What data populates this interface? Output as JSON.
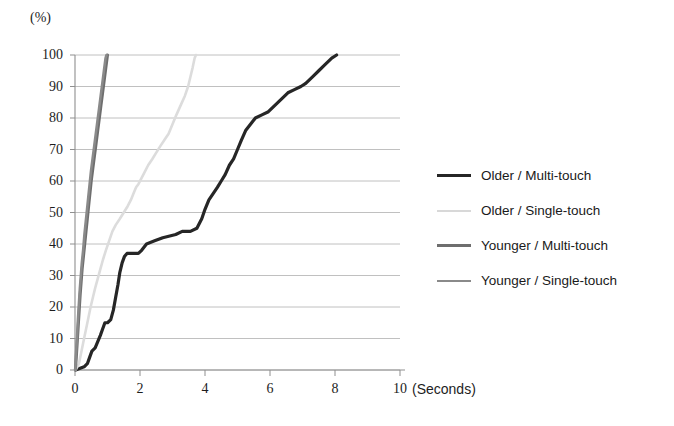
{
  "chart_data": {
    "type": "line",
    "title": "",
    "subtitle": "",
    "xlabel": "(Seconds)",
    "ylabel": "(%)",
    "xlim": [
      0,
      10
    ],
    "ylim": [
      0,
      100
    ],
    "xticks": [
      0,
      2,
      4,
      6,
      8,
      10
    ],
    "yticks": [
      0,
      10,
      20,
      30,
      40,
      50,
      60,
      70,
      80,
      90,
      100
    ],
    "xtick_labels": [
      "0",
      "2",
      "4",
      "6",
      "8",
      "10"
    ],
    "ytick_labels": [
      "0",
      "10",
      "20",
      "30",
      "40",
      "50",
      "60",
      "70",
      "80",
      "90",
      "100"
    ],
    "grid": "horizontal",
    "legend_position": "right",
    "series": [
      {
        "name": "Older / Multi-touch",
        "color": "#262626",
        "width": 3.2,
        "points": [
          [
            0.02,
            0
          ],
          [
            0.28,
            1
          ],
          [
            0.38,
            2
          ],
          [
            0.45,
            4
          ],
          [
            0.52,
            6
          ],
          [
            0.62,
            7
          ],
          [
            0.7,
            9
          ],
          [
            0.78,
            11
          ],
          [
            0.85,
            13
          ],
          [
            0.92,
            15
          ],
          [
            1.0,
            15
          ],
          [
            1.1,
            16
          ],
          [
            1.18,
            19
          ],
          [
            1.25,
            23
          ],
          [
            1.32,
            27
          ],
          [
            1.38,
            31
          ],
          [
            1.45,
            34
          ],
          [
            1.52,
            36
          ],
          [
            1.6,
            37
          ],
          [
            1.95,
            37
          ],
          [
            2.05,
            38
          ],
          [
            2.2,
            40
          ],
          [
            2.45,
            41
          ],
          [
            2.7,
            42
          ],
          [
            3.1,
            43
          ],
          [
            3.3,
            44
          ],
          [
            3.55,
            44
          ],
          [
            3.75,
            45
          ],
          [
            3.9,
            48
          ],
          [
            4.0,
            51
          ],
          [
            4.12,
            54
          ],
          [
            4.25,
            56
          ],
          [
            4.38,
            58
          ],
          [
            4.5,
            60
          ],
          [
            4.62,
            62
          ],
          [
            4.75,
            65
          ],
          [
            4.88,
            67
          ],
          [
            5.0,
            70
          ],
          [
            5.12,
            73
          ],
          [
            5.25,
            76
          ],
          [
            5.4,
            78
          ],
          [
            5.55,
            80
          ],
          [
            5.75,
            81
          ],
          [
            5.95,
            82
          ],
          [
            6.15,
            84
          ],
          [
            6.35,
            86
          ],
          [
            6.55,
            88
          ],
          [
            6.75,
            89
          ],
          [
            6.95,
            90
          ],
          [
            7.1,
            91
          ],
          [
            7.3,
            93
          ],
          [
            7.5,
            95
          ],
          [
            7.7,
            97
          ],
          [
            7.9,
            99
          ],
          [
            8.05,
            100
          ]
        ]
      },
      {
        "name": "Older / Single-touch",
        "color": "#dcdcdc",
        "width": 2.6,
        "points": [
          [
            0.02,
            0
          ],
          [
            0.12,
            2
          ],
          [
            0.18,
            5
          ],
          [
            0.24,
            8
          ],
          [
            0.3,
            11
          ],
          [
            0.36,
            14
          ],
          [
            0.42,
            17
          ],
          [
            0.48,
            20
          ],
          [
            0.55,
            23
          ],
          [
            0.62,
            26
          ],
          [
            0.7,
            29
          ],
          [
            0.78,
            32
          ],
          [
            0.86,
            35
          ],
          [
            0.95,
            38
          ],
          [
            1.05,
            41
          ],
          [
            1.15,
            44
          ],
          [
            1.25,
            46
          ],
          [
            1.38,
            48
          ],
          [
            1.5,
            50
          ],
          [
            1.62,
            52
          ],
          [
            1.72,
            54
          ],
          [
            1.8,
            56
          ],
          [
            1.88,
            58
          ],
          [
            1.95,
            59
          ],
          [
            2.05,
            61
          ],
          [
            2.15,
            63
          ],
          [
            2.25,
            65
          ],
          [
            2.38,
            67
          ],
          [
            2.5,
            69
          ],
          [
            2.62,
            71
          ],
          [
            2.75,
            73
          ],
          [
            2.88,
            75
          ],
          [
            3.0,
            78
          ],
          [
            3.12,
            81
          ],
          [
            3.25,
            84
          ],
          [
            3.38,
            87
          ],
          [
            3.48,
            90
          ],
          [
            3.55,
            93
          ],
          [
            3.62,
            96
          ],
          [
            3.68,
            99
          ],
          [
            3.72,
            100
          ]
        ]
      },
      {
        "name": "Younger / Multi-touch",
        "color": "#6e6e6e",
        "width": 3.0,
        "points": [
          [
            0.01,
            0
          ],
          [
            0.04,
            4
          ],
          [
            0.07,
            9
          ],
          [
            0.1,
            14
          ],
          [
            0.13,
            19
          ],
          [
            0.16,
            24
          ],
          [
            0.19,
            28
          ],
          [
            0.22,
            32
          ],
          [
            0.26,
            36
          ],
          [
            0.3,
            40
          ],
          [
            0.34,
            44
          ],
          [
            0.38,
            48
          ],
          [
            0.42,
            52
          ],
          [
            0.46,
            56
          ],
          [
            0.5,
            60
          ],
          [
            0.55,
            64
          ],
          [
            0.6,
            68
          ],
          [
            0.65,
            72
          ],
          [
            0.7,
            76
          ],
          [
            0.75,
            80
          ],
          [
            0.8,
            84
          ],
          [
            0.85,
            88
          ],
          [
            0.9,
            92
          ],
          [
            0.95,
            96
          ],
          [
            1.0,
            100
          ]
        ]
      },
      {
        "name": "Younger / Single-touch",
        "color": "#8a8a8a",
        "width": 2.6,
        "points": [
          [
            0.01,
            0
          ],
          [
            0.03,
            5
          ],
          [
            0.06,
            10
          ],
          [
            0.09,
            16
          ],
          [
            0.12,
            21
          ],
          [
            0.15,
            26
          ],
          [
            0.18,
            30
          ],
          [
            0.21,
            34
          ],
          [
            0.25,
            38
          ],
          [
            0.29,
            43
          ],
          [
            0.33,
            47
          ],
          [
            0.37,
            51
          ],
          [
            0.41,
            55
          ],
          [
            0.45,
            59
          ],
          [
            0.49,
            63
          ],
          [
            0.54,
            67
          ],
          [
            0.59,
            71
          ],
          [
            0.64,
            75
          ],
          [
            0.69,
            79
          ],
          [
            0.74,
            83
          ],
          [
            0.79,
            87
          ],
          [
            0.84,
            91
          ],
          [
            0.89,
            95
          ],
          [
            0.94,
            99
          ],
          [
            0.97,
            100
          ]
        ]
      }
    ]
  },
  "axes": {
    "y_unit_label": "(%)",
    "x_unit_label": "(Seconds)"
  },
  "legend": {
    "entries": [
      {
        "label": "Older / Multi-touch",
        "color": "#262626",
        "thickness": "3.4px"
      },
      {
        "label": "Older / Single-touch",
        "color": "#d8d8d8",
        "thickness": "2.6px"
      },
      {
        "label": "Younger / Multi-touch",
        "color": "#6e6e6e",
        "thickness": "3.0px"
      },
      {
        "label": "Younger / Single-touch",
        "color": "#8a8a8a",
        "thickness": "2.6px"
      }
    ]
  },
  "plot_geometry": {
    "left": 75,
    "right": 400,
    "top": 55,
    "bottom": 370
  }
}
